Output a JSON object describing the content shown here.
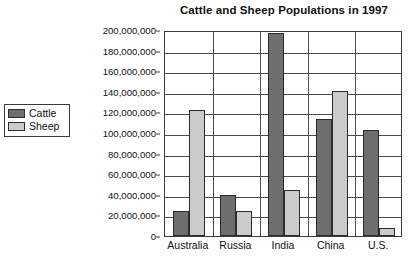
{
  "chart_data": {
    "type": "bar",
    "title": "Cattle and Sheep Populations in 1997",
    "xlabel": "",
    "ylabel": "",
    "categories": [
      "Australia",
      "Russia",
      "India",
      "China",
      "U.S."
    ],
    "series": [
      {
        "name": "Cattle",
        "color": "#6e6e6e",
        "values": [
          24000000,
          40000000,
          197000000,
          114000000,
          103000000
        ]
      },
      {
        "name": "Sheep",
        "color": "#cbcbcb",
        "values": [
          122000000,
          24000000,
          45000000,
          141000000,
          8000000
        ]
      }
    ],
    "ylim": [
      0,
      200000000
    ],
    "ytick_step": 20000000,
    "ytick_labels": [
      "200,000,000",
      "180,000,000",
      "160,000,000",
      "140,000,000",
      "120,000,000",
      "100,000,000",
      "80,000,000",
      "60,000,000",
      "40,000,000",
      "20,000,000",
      "0"
    ],
    "grid": true,
    "legend_position": "left-outside"
  },
  "legend": {
    "items": [
      {
        "label": "Cattle",
        "color": "#6e6e6e"
      },
      {
        "label": "Sheep",
        "color": "#cbcbcb"
      }
    ]
  }
}
